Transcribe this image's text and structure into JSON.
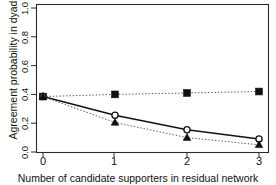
{
  "chart_data": {
    "type": "line",
    "title": "",
    "xlabel": "Number of candidate supporters in residual network",
    "ylabel": "Agreement probability in dyad",
    "x": [
      0,
      1,
      2,
      3
    ],
    "categories": [
      "0",
      "1",
      "2",
      "3"
    ],
    "xtick_labels": [
      "0",
      "1",
      "2",
      "3"
    ],
    "ytick_labels": [
      "0.0",
      "0.2",
      "0.4",
      "0.6",
      "0.8",
      "1.0"
    ],
    "ytick_values": [
      0.0,
      0.2,
      0.4,
      0.6,
      0.8,
      1.0
    ],
    "xlim": [
      -0.18,
      3.18
    ],
    "ylim": [
      0.0,
      1.05
    ],
    "grid": false,
    "legend": "none",
    "series": [
      {
        "name": "filled-square-series",
        "marker": "square",
        "linestyle": "dotted",
        "color": "#111111",
        "values": [
          0.385,
          0.4,
          0.41,
          0.42
        ]
      },
      {
        "name": "open-circle-series",
        "marker": "circle-open",
        "linestyle": "solid",
        "color": "#111111",
        "values": [
          0.385,
          0.255,
          0.155,
          0.09
        ]
      },
      {
        "name": "filled-triangle-series",
        "marker": "triangle",
        "linestyle": "dotted",
        "color": "#111111",
        "values": [
          0.385,
          0.205,
          0.1,
          0.05
        ]
      }
    ]
  },
  "axis": {
    "y_title": "Agreement probability in dyad",
    "x_title": "Number of candidate supporters in residual network",
    "y_ticks": [
      "1.0",
      "0.8",
      "0.6",
      "0.4",
      "0.2",
      "0.0"
    ],
    "x_ticks": [
      "0",
      "1",
      "2",
      "3"
    ]
  }
}
